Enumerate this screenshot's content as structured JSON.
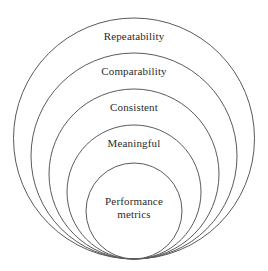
{
  "diagram": {
    "type": "nested-concentric-circles",
    "title": "",
    "stroke_color": "#5a5a5a",
    "text_color": "#2b2b2b",
    "background_color": "#ffffff",
    "tangent_point": {
      "x": 134,
      "y": 259
    },
    "rings": [
      {
        "id": "repeatability",
        "label": "Repeatability",
        "level": 1,
        "cx": 134,
        "cy": 138.5,
        "r": 120.5,
        "label_x": 134,
        "label_y": 36
      },
      {
        "id": "comparability",
        "label": "Comparability",
        "level": 2,
        "cx": 134,
        "cy": 156,
        "r": 103,
        "label_x": 134,
        "label_y": 71
      },
      {
        "id": "consistent",
        "label": "Consistent",
        "level": 3,
        "cx": 134,
        "cy": 174,
        "r": 85,
        "label_x": 134,
        "label_y": 107
      },
      {
        "id": "meaningful",
        "label": "Meaningful",
        "level": 4,
        "cx": 134,
        "cy": 192,
        "r": 67,
        "label_x": 134,
        "label_y": 143
      },
      {
        "id": "performance-metrics",
        "label": "Performance\nmetrics",
        "level": 5,
        "cx": 134,
        "cy": 211,
        "r": 48,
        "label_x": 134,
        "label_y": 208
      }
    ]
  }
}
